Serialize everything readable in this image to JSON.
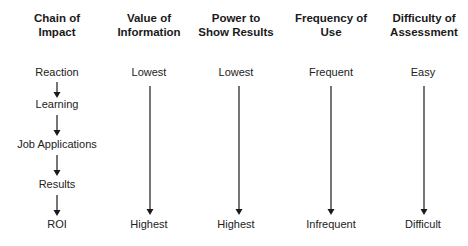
{
  "diagram": {
    "columns": [
      {
        "header": "Chain of Impact",
        "header_line1": "Chain of",
        "header_line2": "Impact",
        "levels": [
          "Reaction",
          "Learning",
          "Job Applications",
          "Results",
          "ROI"
        ]
      },
      {
        "header": "Value of Information",
        "header_line1": "Value of",
        "header_line2": "Information",
        "top": "Lowest",
        "bottom": "Highest"
      },
      {
        "header": "Power to Show Results",
        "header_line1": "Power to",
        "header_line2": "Show Results",
        "top": "Lowest",
        "bottom": "Highest"
      },
      {
        "header": "Frequency of Use",
        "header_line1": "Frequency of",
        "header_line2": "Use",
        "top": "Frequent",
        "bottom": "Infrequent"
      },
      {
        "header": "Difficulty of Assessment",
        "header_line1": "Difficulty of",
        "header_line2": "Assessment",
        "top": "Easy",
        "bottom": "Difficult"
      }
    ],
    "arrow_color": "#1a1a1a"
  }
}
